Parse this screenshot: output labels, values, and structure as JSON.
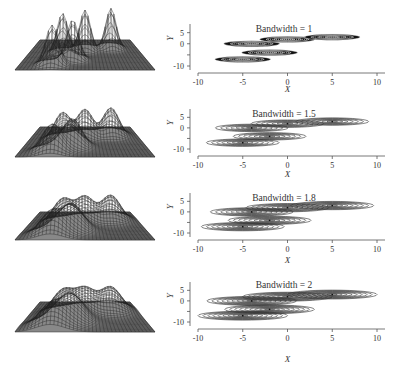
{
  "chart_data": [
    {
      "type": "contour",
      "title": "Bandwidth = 1",
      "bandwidth": 1,
      "xlabel": "X",
      "ylabel": "Y",
      "xticks": [
        -10,
        -5,
        0,
        5,
        10
      ],
      "yticks": [
        5,
        0,
        -10
      ],
      "xlim": [
        -10,
        10
      ],
      "ylim": [
        -10,
        8
      ],
      "centers": [
        [
          -5,
          -7
        ],
        [
          -4,
          0
        ],
        [
          -2,
          -4
        ],
        [
          0,
          2
        ],
        [
          5,
          3
        ]
      ],
      "companion_plot": "3D wireframe density surface with five distinct peaks"
    },
    {
      "type": "contour",
      "title": "Bandwidth = 1.5",
      "bandwidth": 1.5,
      "xlabel": "X",
      "ylabel": "Y",
      "xticks": [
        -10,
        -5,
        0,
        5,
        10
      ],
      "yticks": [
        5,
        0,
        -10
      ],
      "xlim": [
        -10,
        10
      ],
      "ylim": [
        -10,
        8
      ],
      "centers": [
        [
          -5,
          -7
        ],
        [
          -4,
          0
        ],
        [
          -2,
          -4
        ],
        [
          0,
          2
        ],
        [
          5,
          3
        ]
      ],
      "companion_plot": "3D wireframe density surface with smoother overlapping peaks"
    },
    {
      "type": "contour",
      "title": "Bandwidth = 1.8",
      "bandwidth": 1.8,
      "xlabel": "X",
      "ylabel": "Y",
      "xticks": [
        -10,
        -5,
        0,
        5,
        10
      ],
      "yticks": [
        5,
        0,
        -10
      ],
      "xlim": [
        -10,
        10
      ],
      "ylim": [
        -10,
        8
      ],
      "centers": [
        [
          -5,
          -7
        ],
        [
          -4,
          0
        ],
        [
          -2,
          -4
        ],
        [
          0,
          2
        ],
        [
          5,
          3
        ]
      ],
      "companion_plot": "3D wireframe density surface with merged ridges"
    },
    {
      "type": "contour",
      "title": "Bandwidth = 2",
      "bandwidth": 2,
      "xlabel": "X",
      "ylabel": "Y",
      "xticks": [
        -10,
        -5,
        0,
        5,
        10
      ],
      "yticks": [
        5,
        0,
        -10
      ],
      "xlim": [
        -10,
        10
      ],
      "ylim": [
        -10,
        8
      ],
      "centers": [
        [
          -5,
          -7
        ],
        [
          -4,
          0
        ],
        [
          -2,
          -4
        ],
        [
          0,
          2
        ],
        [
          5,
          3
        ]
      ],
      "companion_plot": "3D wireframe density surface with broad smooth hills"
    }
  ],
  "panels": [
    {
      "title": "Bandwidth = 1",
      "xlabel": "X",
      "ylabel": "Y",
      "xt": [
        "-10",
        "-5",
        "0",
        "5",
        "10"
      ],
      "yt": [
        "5",
        "0",
        "-10"
      ]
    },
    {
      "title": "Bandwidth = 1.5",
      "xlabel": "X",
      "ylabel": "Y",
      "xt": [
        "-10",
        "-5",
        "0",
        "5",
        "10"
      ],
      "yt": [
        "5",
        "0",
        "-10"
      ]
    },
    {
      "title": "Bandwidth = 1.8",
      "xlabel": "X",
      "ylabel": "Y",
      "xt": [
        "-10",
        "-5",
        "0",
        "5",
        "10"
      ],
      "yt": [
        "5",
        "0",
        "-10"
      ]
    },
    {
      "title": "Bandwidth = 2",
      "xlabel": "X",
      "ylabel": "Y",
      "xt": [
        "-10",
        "-5",
        "0",
        "5",
        "10"
      ],
      "yt": [
        "5",
        "0",
        "-10"
      ]
    }
  ]
}
